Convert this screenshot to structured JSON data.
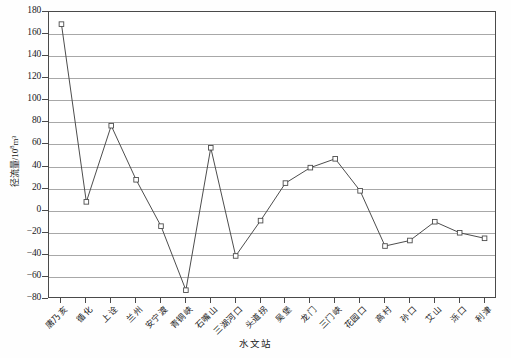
{
  "chart_data": {
    "type": "line",
    "title": "",
    "xlabel": "水文站",
    "ylabel": "径流量/10⁸m³",
    "ylabel_main": "径流量/10",
    "ylabel_sup": "8",
    "ylabel_tail": "m³",
    "ylim": [
      -80,
      180
    ],
    "ytick_step": 20,
    "yticks": [
      180,
      160,
      140,
      120,
      100,
      80,
      60,
      40,
      20,
      0,
      -20,
      -40,
      -60,
      -80
    ],
    "grid": true,
    "legend": "none",
    "marker": "open-square",
    "line_color": "#4d4d4d",
    "grid_color": "#a8a8a8",
    "axis_color": "#4a4a4a",
    "categories": [
      "唐乃亥",
      "循化",
      "上诠",
      "兰州",
      "安宁渡",
      "青铜峡",
      "石嘴山",
      "三湖河口",
      "头道拐",
      "吴堡",
      "龙门",
      "三门峡",
      "花园口",
      "高村",
      "孙口",
      "艾山",
      "泺口",
      "利津"
    ],
    "values": [
      169,
      8,
      77,
      28,
      -14,
      -72,
      57,
      -41,
      -9,
      25,
      39,
      47,
      18,
      -32,
      -27,
      -10,
      -20,
      -25
    ]
  }
}
